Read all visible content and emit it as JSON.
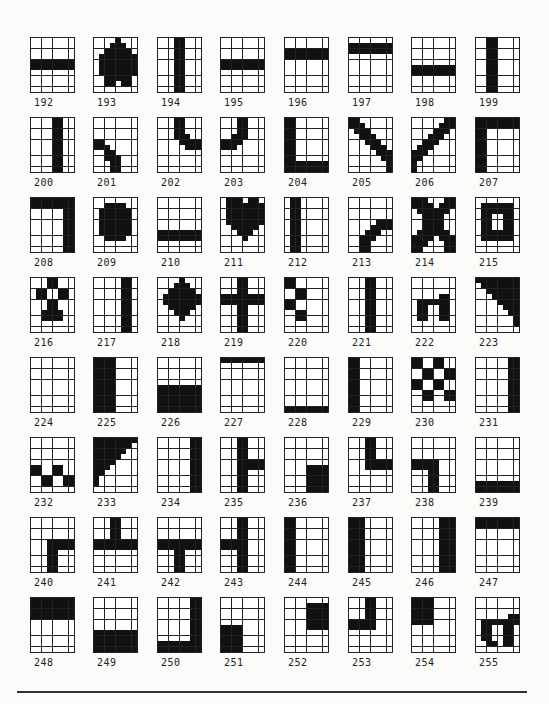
{
  "page": {
    "grid_cols": 8,
    "grid_rows": 10,
    "layout": {
      "column_x": [
        30,
        93,
        157,
        220,
        284,
        348,
        411,
        475
      ],
      "row_y": [
        37,
        117,
        197,
        277,
        357,
        437,
        517,
        597
      ]
    }
  },
  "characters": [
    {
      "code": "192",
      "rows": [
        "00000000",
        "00000000",
        "00000000",
        "00000000",
        "11111111",
        "11111111",
        "00000000",
        "00000000",
        "00000000",
        "00000000"
      ]
    },
    {
      "code": "193",
      "rows": [
        "00001000",
        "00011100",
        "00111110",
        "01111111",
        "01111111",
        "01111111",
        "01111111",
        "00111110",
        "00110110",
        "00000000"
      ]
    },
    {
      "code": "194",
      "rows": [
        "00011000",
        "00011000",
        "00011000",
        "00011000",
        "00011000",
        "00011000",
        "00011000",
        "00011000",
        "00011000",
        "00011000"
      ]
    },
    {
      "code": "195",
      "rows": [
        "00000000",
        "00000000",
        "00000000",
        "00000000",
        "11111111",
        "11111111",
        "00000000",
        "00000000",
        "00000000",
        "00000000"
      ]
    },
    {
      "code": "196",
      "rows": [
        "00000000",
        "00000000",
        "11111111",
        "11111111",
        "00000000",
        "00000000",
        "00000000",
        "00000000",
        "00000000",
        "00000000"
      ]
    },
    {
      "code": "197",
      "rows": [
        "00000000",
        "11111111",
        "11111111",
        "00000000",
        "00000000",
        "00000000",
        "00000000",
        "00000000",
        "00000000",
        "00000000"
      ]
    },
    {
      "code": "198",
      "rows": [
        "00000000",
        "00000000",
        "00000000",
        "00000000",
        "00000000",
        "11111111",
        "11111111",
        "00000000",
        "00000000",
        "00000000"
      ]
    },
    {
      "code": "199",
      "rows": [
        "00110000",
        "00110000",
        "00110000",
        "00110000",
        "00110000",
        "00110000",
        "00110000",
        "00110000",
        "00110000",
        "00110000"
      ]
    },
    {
      "code": "200",
      "rows": [
        "00001100",
        "00001100",
        "00001100",
        "00001100",
        "00001100",
        "00001100",
        "00001100",
        "00001100",
        "00001100",
        "00001100"
      ]
    },
    {
      "code": "201",
      "rows": [
        "00000000",
        "00000000",
        "00000000",
        "00000000",
        "11000000",
        "11100000",
        "00110000",
        "00111000",
        "00011000",
        "00011000"
      ]
    },
    {
      "code": "202",
      "rows": [
        "00011000",
        "00011000",
        "00011000",
        "00011100",
        "00001111",
        "00000111",
        "00000000",
        "00000000",
        "00000000",
        "00000000"
      ]
    },
    {
      "code": "203",
      "rows": [
        "00011000",
        "00011000",
        "00011000",
        "00111000",
        "11110000",
        "11100000",
        "00000000",
        "00000000",
        "00000000",
        "00000000"
      ]
    },
    {
      "code": "204",
      "rows": [
        "11000000",
        "11000000",
        "11000000",
        "11000000",
        "11000000",
        "11000000",
        "11000000",
        "11000000",
        "11111111",
        "11111111"
      ]
    },
    {
      "code": "205",
      "rows": [
        "11000000",
        "11100000",
        "01110000",
        "00111000",
        "00011100",
        "00001110",
        "00000111",
        "00000011",
        "00000001",
        "00000001"
      ]
    },
    {
      "code": "206",
      "rows": [
        "00000011",
        "00000111",
        "00001110",
        "00011100",
        "00111000",
        "01110000",
        "11100000",
        "11000000",
        "10000000",
        "10000000"
      ]
    },
    {
      "code": "207",
      "rows": [
        "11111111",
        "11111111",
        "11000000",
        "11000000",
        "11000000",
        "11000000",
        "11000000",
        "11000000",
        "11000000",
        "11000000"
      ]
    },
    {
      "code": "208",
      "rows": [
        "11111111",
        "11111111",
        "00000011",
        "00000011",
        "00000011",
        "00000011",
        "00000011",
        "00000011",
        "00000011",
        "00000011"
      ]
    },
    {
      "code": "209",
      "rows": [
        "00000000",
        "00111100",
        "01111110",
        "01111110",
        "01111110",
        "01111110",
        "01111110",
        "00111100",
        "00000000",
        "00000000"
      ]
    },
    {
      "code": "210",
      "rows": [
        "00000000",
        "00000000",
        "00000000",
        "00000000",
        "00000000",
        "00000000",
        "11111111",
        "11111111",
        "00000000",
        "00000000"
      ]
    },
    {
      "code": "211",
      "rows": [
        "01110110",
        "01111111",
        "01111111",
        "01111111",
        "01111111",
        "00111110",
        "00011100",
        "00001000",
        "00000000",
        "00000000"
      ]
    },
    {
      "code": "212",
      "rows": [
        "01100000",
        "01100000",
        "01100000",
        "01100000",
        "01100000",
        "01100000",
        "01100000",
        "01100000",
        "01100000",
        "01100000"
      ]
    },
    {
      "code": "213",
      "rows": [
        "00000000",
        "00000000",
        "00000000",
        "00000000",
        "00000111",
        "00001111",
        "00011100",
        "00111000",
        "00110000",
        "00110000"
      ]
    },
    {
      "code": "214",
      "rows": [
        "11100011",
        "11110111",
        "01111110",
        "00111100",
        "00111100",
        "00111100",
        "01111110",
        "11110111",
        "11100011",
        "11000011"
      ]
    },
    {
      "code": "215",
      "rows": [
        "00000000",
        "01111110",
        "01111110",
        "01100110",
        "01100110",
        "01100110",
        "01111110",
        "01111110",
        "00000000",
        "00000000"
      ]
    },
    {
      "code": "216",
      "rows": [
        "00011000",
        "00011000",
        "01100110",
        "01100110",
        "00011000",
        "00011000",
        "00111100",
        "00111100",
        "00000000",
        "00000000"
      ]
    },
    {
      "code": "217",
      "rows": [
        "00000110",
        "00000110",
        "00000110",
        "00000110",
        "00000110",
        "00000110",
        "00000110",
        "00000110",
        "00000110",
        "00000110"
      ]
    },
    {
      "code": "218",
      "rows": [
        "00001000",
        "00011100",
        "00111110",
        "01111111",
        "01111111",
        "00111110",
        "00011100",
        "00001000",
        "00000000",
        "00000000"
      ]
    },
    {
      "code": "219",
      "rows": [
        "00011000",
        "00011000",
        "00011000",
        "11111111",
        "11111111",
        "00011000",
        "00011000",
        "00011000",
        "00011000",
        "00011000"
      ]
    },
    {
      "code": "220",
      "rows": [
        "11000000",
        "11000000",
        "00110000",
        "00110000",
        "11000000",
        "11000000",
        "00110000",
        "00110000",
        "00000000",
        "00000000"
      ]
    },
    {
      "code": "221",
      "rows": [
        "00011000",
        "00011000",
        "00011000",
        "00011000",
        "00011000",
        "00011000",
        "00011000",
        "00011000",
        "00011000",
        "00011000"
      ]
    },
    {
      "code": "222",
      "rows": [
        "00000000",
        "00000000",
        "00000000",
        "00000110",
        "01111110",
        "01100110",
        "01100110",
        "01100110",
        "00000000",
        "00000000"
      ]
    },
    {
      "code": "223",
      "rows": [
        "11111111",
        "01111111",
        "00111111",
        "00011111",
        "00001111",
        "00000111",
        "00000011",
        "00000001",
        "00000001",
        "00000000"
      ]
    },
    {
      "code": "224",
      "rows": [
        "00000000",
        "00000000",
        "00000000",
        "00000000",
        "00000000",
        "00000000",
        "00000000",
        "00000000",
        "00000000",
        "00000000"
      ]
    },
    {
      "code": "225",
      "rows": [
        "11110000",
        "11110000",
        "11110000",
        "11110000",
        "11110000",
        "11110000",
        "11110000",
        "11110000",
        "11110000",
        "11110000"
      ]
    },
    {
      "code": "226",
      "rows": [
        "00000000",
        "00000000",
        "00000000",
        "00000000",
        "00000000",
        "11111111",
        "11111111",
        "11111111",
        "11111111",
        "11111111"
      ]
    },
    {
      "code": "227",
      "rows": [
        "11111111",
        "00000000",
        "00000000",
        "00000000",
        "00000000",
        "00000000",
        "00000000",
        "00000000",
        "00000000",
        "00000000"
      ]
    },
    {
      "code": "228",
      "rows": [
        "00000000",
        "00000000",
        "00000000",
        "00000000",
        "00000000",
        "00000000",
        "00000000",
        "00000000",
        "00000000",
        "11111111"
      ]
    },
    {
      "code": "229",
      "rows": [
        "11000000",
        "11000000",
        "11000000",
        "11000000",
        "11000000",
        "11000000",
        "11000000",
        "11000000",
        "11000000",
        "11000000"
      ]
    },
    {
      "code": "230",
      "rows": [
        "11001100",
        "11001100",
        "00110011",
        "00110011",
        "11001100",
        "11001100",
        "00110011",
        "00110011",
        "00000000",
        "00000000"
      ]
    },
    {
      "code": "231",
      "rows": [
        "00000011",
        "00000011",
        "00000011",
        "00000011",
        "00000011",
        "00000011",
        "00000011",
        "00000011",
        "00000011",
        "00000011"
      ]
    },
    {
      "code": "232",
      "rows": [
        "00000000",
        "00000000",
        "00000000",
        "00000000",
        "00000000",
        "11001100",
        "11001100",
        "00110011",
        "00110011",
        "00000000"
      ]
    },
    {
      "code": "233",
      "rows": [
        "11111111",
        "11111110",
        "11111100",
        "11111000",
        "11110000",
        "11100000",
        "11000000",
        "10000000",
        "10000000",
        "00000000"
      ]
    },
    {
      "code": "234",
      "rows": [
        "00000011",
        "00000011",
        "00000011",
        "00000011",
        "00000011",
        "00000011",
        "00000011",
        "00000011",
        "00000011",
        "00000011"
      ]
    },
    {
      "code": "235",
      "rows": [
        "00011000",
        "00011000",
        "00011000",
        "00011000",
        "00011111",
        "00011111",
        "00011000",
        "00011000",
        "00011000",
        "00011000"
      ]
    },
    {
      "code": "236",
      "rows": [
        "00000000",
        "00000000",
        "00000000",
        "00000000",
        "00000000",
        "00001111",
        "00001111",
        "00001111",
        "00001111",
        "00001111"
      ]
    },
    {
      "code": "237",
      "rows": [
        "00011000",
        "00011000",
        "00011000",
        "00011000",
        "00011111",
        "00011111",
        "00000000",
        "00000000",
        "00000000",
        "00000000"
      ]
    },
    {
      "code": "238",
      "rows": [
        "00000000",
        "00000000",
        "00000000",
        "00000000",
        "11111000",
        "11111000",
        "00011000",
        "00011000",
        "00011000",
        "00011000"
      ]
    },
    {
      "code": "239",
      "rows": [
        "00000000",
        "00000000",
        "00000000",
        "00000000",
        "00000000",
        "00000000",
        "00000000",
        "00000000",
        "11111111",
        "11111111"
      ]
    },
    {
      "code": "240",
      "rows": [
        "00000000",
        "00000000",
        "00000000",
        "00000000",
        "00011111",
        "00011111",
        "00011000",
        "00011000",
        "00011000",
        "00011000"
      ]
    },
    {
      "code": "241",
      "rows": [
        "00011000",
        "00011000",
        "00011000",
        "00011000",
        "11111111",
        "11111111",
        "00000000",
        "00000000",
        "00000000",
        "00000000"
      ]
    },
    {
      "code": "242",
      "rows": [
        "00000000",
        "00000000",
        "00000000",
        "00000000",
        "11111111",
        "11111111",
        "00011000",
        "00011000",
        "00011000",
        "00011000"
      ]
    },
    {
      "code": "243",
      "rows": [
        "00011000",
        "00011000",
        "00011000",
        "00011000",
        "11111000",
        "11111000",
        "00011000",
        "00011000",
        "00011000",
        "00011000"
      ]
    },
    {
      "code": "244",
      "rows": [
        "11000000",
        "11000000",
        "11000000",
        "11000000",
        "11000000",
        "11000000",
        "11000000",
        "11000000",
        "11000000",
        "11000000"
      ]
    },
    {
      "code": "245",
      "rows": [
        "11100000",
        "11100000",
        "11100000",
        "11100000",
        "11100000",
        "11100000",
        "11100000",
        "11100000",
        "11100000",
        "11100000"
      ]
    },
    {
      "code": "246",
      "rows": [
        "00000111",
        "00000111",
        "00000111",
        "00000111",
        "00000111",
        "00000111",
        "00000111",
        "00000111",
        "00000111",
        "00000111"
      ]
    },
    {
      "code": "247",
      "rows": [
        "11111111",
        "11111111",
        "00000000",
        "00000000",
        "00000000",
        "00000000",
        "00000000",
        "00000000",
        "00000000",
        "00000000"
      ]
    },
    {
      "code": "248",
      "rows": [
        "11111111",
        "11111111",
        "11111111",
        "11111111",
        "00000000",
        "00000000",
        "00000000",
        "00000000",
        "00000000",
        "00000000"
      ]
    },
    {
      "code": "249",
      "rows": [
        "00000000",
        "00000000",
        "00000000",
        "00000000",
        "00000000",
        "00000000",
        "11111111",
        "11111111",
        "11111111",
        "11111111"
      ]
    },
    {
      "code": "250",
      "rows": [
        "00000011",
        "00000011",
        "00000011",
        "00000011",
        "00000011",
        "00000011",
        "00000011",
        "00000011",
        "11111111",
        "11111111"
      ]
    },
    {
      "code": "251",
      "rows": [
        "00000000",
        "00000000",
        "00000000",
        "00000000",
        "00000000",
        "11110000",
        "11110000",
        "11110000",
        "11110000",
        "11110000"
      ]
    },
    {
      "code": "252",
      "rows": [
        "00000000",
        "00001111",
        "00001111",
        "00001111",
        "00001111",
        "00001111",
        "00000000",
        "00000000",
        "00000000",
        "00000000"
      ]
    },
    {
      "code": "253",
      "rows": [
        "00011000",
        "00011000",
        "00011000",
        "00011000",
        "11111000",
        "11111000",
        "00000000",
        "00000000",
        "00000000",
        "00000000"
      ]
    },
    {
      "code": "254",
      "rows": [
        "11110000",
        "11110000",
        "11110000",
        "11110000",
        "11110000",
        "00000000",
        "00000000",
        "00000000",
        "00000000",
        "00000000"
      ]
    },
    {
      "code": "255",
      "rows": [
        "00000000",
        "00000000",
        "00000000",
        "00000011",
        "01111111",
        "01100110",
        "01100110",
        "01100110",
        "00110110",
        "00000000"
      ]
    }
  ]
}
